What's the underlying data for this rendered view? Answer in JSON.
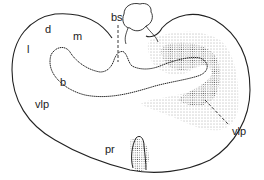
{
  "figure": {
    "labels": {
      "bs": "bs",
      "d": "d",
      "m": "m",
      "l": "l",
      "b": "b",
      "vlp_left": "vlp",
      "vlp_right": "vlp",
      "pr": "pr"
    },
    "colors": {
      "outline": "#222222",
      "stipple": "#333333",
      "background": "#ffffff"
    }
  }
}
